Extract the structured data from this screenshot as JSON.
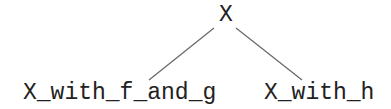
{
  "diagram": {
    "type": "tree",
    "root": {
      "label": "X"
    },
    "children": [
      {
        "label": "X_with_f_and_g"
      },
      {
        "label": "X_with_h"
      }
    ],
    "colors": {
      "text": "#222222",
      "edge": "#666666",
      "background": "#ffffff"
    }
  }
}
